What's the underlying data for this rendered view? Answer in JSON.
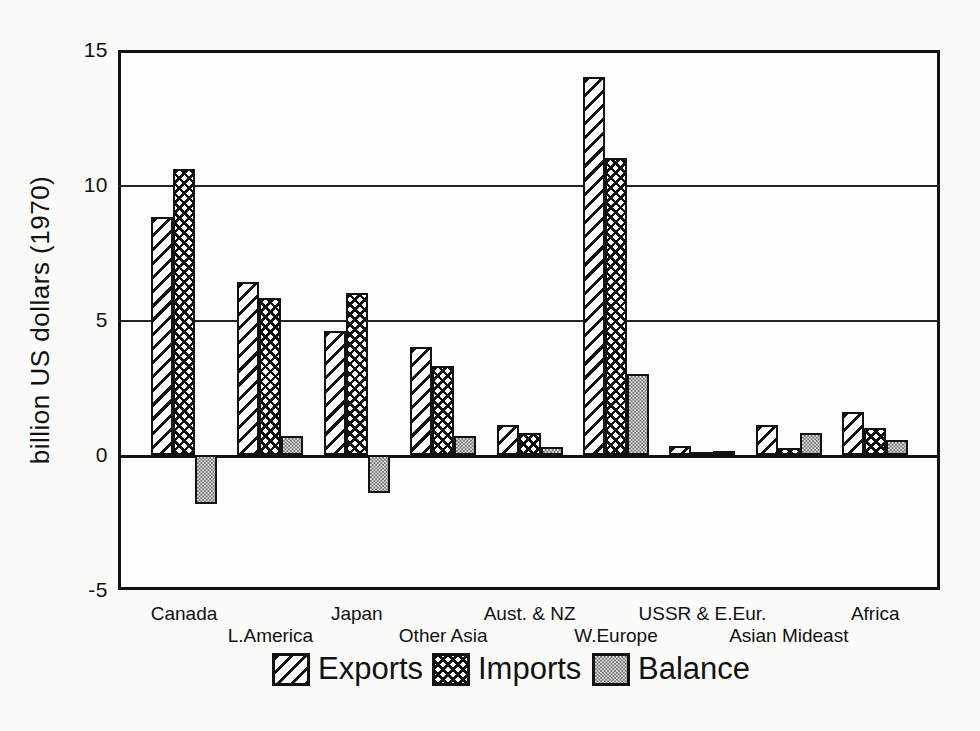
{
  "page": {
    "background": "#fbfbf9",
    "ink": "#111111",
    "balance_gray": "#9a9a97"
  },
  "y_axis": {
    "title": "billion US dollars (1970)",
    "ticks": [
      15,
      10,
      5,
      0,
      -5
    ],
    "gridlines": [
      10,
      5
    ]
  },
  "chart_data": {
    "type": "bar",
    "title": "",
    "xlabel": "",
    "ylabel": "billion US dollars (1970)",
    "ylim": [
      -5,
      15
    ],
    "grid": "horizontal at 0, 5, 10",
    "legend_position": "bottom",
    "categories": [
      "Canada",
      "L.America",
      "Japan",
      "Other Asia",
      "Aust. & NZ",
      "W.Europe",
      "USSR & E.Eur.",
      "Asian Mideast",
      "Africa"
    ],
    "series": [
      {
        "name": "Exports",
        "pattern": "diagonal-hatch",
        "values": [
          8.8,
          6.4,
          4.6,
          4.0,
          1.1,
          14.0,
          0.35,
          1.1,
          1.6
        ]
      },
      {
        "name": "Imports",
        "pattern": "crosshatch",
        "values": [
          10.6,
          5.8,
          6.0,
          3.3,
          0.8,
          11.0,
          0.1,
          0.25,
          1.0
        ]
      },
      {
        "name": "Balance",
        "pattern": "gray-stipple",
        "values": [
          -1.8,
          0.7,
          -1.4,
          0.7,
          0.3,
          3.0,
          0.15,
          0.8,
          0.55
        ]
      }
    ]
  },
  "legend": {
    "entries": [
      {
        "label": "Exports",
        "swatch": "diagonal-hatch-swatch"
      },
      {
        "label": "Imports",
        "swatch": "crosshatch-swatch"
      },
      {
        "label": "Balance",
        "swatch": "gray-stipple-swatch"
      }
    ]
  }
}
